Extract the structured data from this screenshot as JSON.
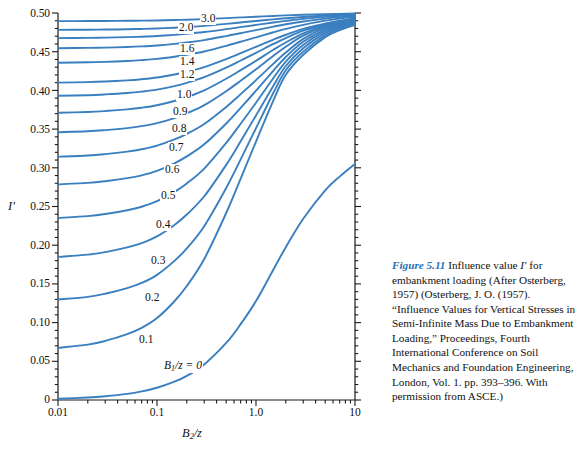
{
  "figure": {
    "caption_figno": "Figure 5.11",
    "caption_text": " Influence value I′ for embankment loading (After Osterberg, 1957) (Osterberg, J. O. (1957). “Influence Values for Vertical Stresses in Semi-Infinite Mass Due to Embankment Loading,” Proceedings, Fourth International Conference on Soil Mechanics and Foundation Engineering, London, Vol. 1. pp. 393–396. With permission from ASCE.)"
  },
  "axes": {
    "y_label": "I′",
    "x_label_main": "B",
    "x_label_sub": "2",
    "x_label_rest": "/z",
    "y_ticks": [
      "0",
      "0.05",
      "0.10",
      "0.15",
      "0.20",
      "0.25",
      "0.30",
      "0.35",
      "0.40",
      "0.45",
      "0.50"
    ],
    "x_ticks": [
      "0.01",
      "0.1",
      "1.0",
      "10"
    ]
  },
  "curve_labels": [
    "3.0",
    "2.0",
    "1.6",
    "1.4",
    "1.2",
    "1.0",
    "0.9",
    "0.8",
    "0.7",
    "0.6",
    "0.5",
    "0.4",
    "0.3",
    "0.2",
    "0.1"
  ],
  "baseline_label": {
    "symbol": "B",
    "subscript": "1",
    "rest": "/z = 0"
  },
  "colors": {
    "curve": "#3a7fbf",
    "axis": "#1a1a1a",
    "caption_accent": "#1f6fb5",
    "background": "#ffffff"
  },
  "chart_data": {
    "type": "line",
    "title": "Influence value I′ for embankment loading",
    "xlabel": "B2/z",
    "ylabel": "I′",
    "xscale": "log",
    "yscale": "linear",
    "xlim": [
      0.01,
      10
    ],
    "ylim": [
      0,
      0.5
    ],
    "grid": false,
    "legend": "inline-curve-labels",
    "x": [
      0.01,
      0.02,
      0.03,
      0.05,
      0.07,
      0.1,
      0.15,
      0.2,
      0.3,
      0.5,
      0.7,
      1.0,
      1.5,
      2.0,
      3.0,
      5.0,
      7.0,
      10.0
    ],
    "series": [
      {
        "name": "3.0",
        "values": [
          0.4895,
          0.4896,
          0.4897,
          0.4899,
          0.4901,
          0.4904,
          0.4909,
          0.4913,
          0.4921,
          0.4934,
          0.4943,
          0.4952,
          0.4962,
          0.4969,
          0.4977,
          0.4985,
          0.4989,
          0.4993
        ]
      },
      {
        "name": "2.0",
        "values": [
          0.4782,
          0.4784,
          0.4786,
          0.479,
          0.4794,
          0.48,
          0.481,
          0.4819,
          0.4834,
          0.486,
          0.4878,
          0.4897,
          0.4918,
          0.4932,
          0.4949,
          0.4966,
          0.4975,
          0.4983
        ]
      },
      {
        "name": "1.6",
        "values": [
          0.4676,
          0.4679,
          0.4682,
          0.4688,
          0.4694,
          0.4703,
          0.4718,
          0.4731,
          0.4754,
          0.4791,
          0.4818,
          0.4846,
          0.4878,
          0.4898,
          0.4924,
          0.495,
          0.4963,
          0.4974
        ]
      },
      {
        "name": "1.4",
        "values": [
          0.4545,
          0.4549,
          0.4553,
          0.4561,
          0.4569,
          0.4581,
          0.4601,
          0.4619,
          0.465,
          0.4702,
          0.4739,
          0.4779,
          0.4824,
          0.4854,
          0.4891,
          0.4928,
          0.4947,
          0.4963
        ]
      },
      {
        "name": "1.2",
        "values": [
          0.4358,
          0.4363,
          0.4369,
          0.438,
          0.4391,
          0.4407,
          0.4435,
          0.446,
          0.4503,
          0.4576,
          0.4629,
          0.4686,
          0.4751,
          0.4794,
          0.4847,
          0.4901,
          0.4928,
          0.4951
        ]
      },
      {
        "name": "1.0",
        "values": [
          0.41,
          0.4107,
          0.4115,
          0.413,
          0.4145,
          0.4167,
          0.4206,
          0.4241,
          0.4302,
          0.4405,
          0.4481,
          0.4563,
          0.4657,
          0.4719,
          0.4796,
          0.4864,
          0.4901,
          0.4933
        ]
      },
      {
        "name": "0.9",
        "values": [
          0.393,
          0.3938,
          0.3948,
          0.3966,
          0.3984,
          0.401,
          0.4056,
          0.4098,
          0.4171,
          0.4294,
          0.4386,
          0.4485,
          0.46,
          0.4676,
          0.4771,
          0.4855,
          0.4891,
          0.4925
        ]
      },
      {
        "name": "0.8",
        "values": [
          0.3711,
          0.3721,
          0.3733,
          0.3755,
          0.3776,
          0.3808,
          0.3863,
          0.3913,
          0.4001,
          0.4151,
          0.4262,
          0.4383,
          0.4525,
          0.4619,
          0.4736,
          0.4839,
          0.4881,
          0.4916
        ]
      },
      {
        "name": "0.7",
        "values": [
          0.346,
          0.3472,
          0.3487,
          0.3513,
          0.3538,
          0.3577,
          0.3643,
          0.3703,
          0.3809,
          0.399,
          0.4125,
          0.4273,
          0.4447,
          0.4563,
          0.4707,
          0.4827,
          0.4872,
          0.4908
        ]
      },
      {
        "name": "0.6",
        "values": [
          0.3144,
          0.3159,
          0.3177,
          0.3209,
          0.3239,
          0.3286,
          0.3366,
          0.3439,
          0.3567,
          0.3787,
          0.3952,
          0.4133,
          0.4346,
          0.4489,
          0.4666,
          0.481,
          0.4861,
          0.49
        ]
      },
      {
        "name": "0.5",
        "values": [
          0.2786,
          0.2805,
          0.2827,
          0.2866,
          0.2903,
          0.2961,
          0.3058,
          0.3147,
          0.3303,
          0.3572,
          0.3774,
          0.3996,
          0.4257,
          0.4432,
          0.4628,
          0.4789,
          0.4847,
          0.4892
        ]
      },
      {
        "name": "0.4",
        "values": [
          0.2352,
          0.2376,
          0.2403,
          0.2452,
          0.2497,
          0.2568,
          0.2689,
          0.2798,
          0.299,
          0.3321,
          0.3569,
          0.3841,
          0.416,
          0.4373,
          0.4588,
          0.4765,
          0.4831,
          0.4881
        ]
      },
      {
        "name": "0.3",
        "values": [
          0.1849,
          0.1878,
          0.1911,
          0.1971,
          0.2027,
          0.2114,
          0.2262,
          0.2396,
          0.2632,
          0.3038,
          0.3343,
          0.3676,
          0.4061,
          0.4315,
          0.4545,
          0.4739,
          0.4813,
          0.4869
        ]
      },
      {
        "name": "0.2",
        "values": [
          0.1298,
          0.1333,
          0.1373,
          0.1445,
          0.1512,
          0.1617,
          0.1797,
          0.1959,
          0.2246,
          0.2739,
          0.3108,
          0.3512,
          0.3969,
          0.4261,
          0.4501,
          0.4712,
          0.4795,
          0.4857
        ]
      },
      {
        "name": "0.1",
        "values": [
          0.0673,
          0.0715,
          0.0763,
          0.085,
          0.0931,
          0.1058,
          0.1276,
          0.1473,
          0.1822,
          0.2416,
          0.2859,
          0.3339,
          0.3871,
          0.4201,
          0.446,
          0.4688,
          0.4778,
          0.4845
        ]
      },
      {
        "name": "0",
        "values": [
          0.0016,
          0.0032,
          0.0048,
          0.0079,
          0.0111,
          0.0158,
          0.0236,
          0.0312,
          0.046,
          0.0737,
          0.098,
          0.1278,
          0.1686,
          0.1974,
          0.2341,
          0.2709,
          0.2886,
          0.3049
        ]
      }
    ]
  }
}
